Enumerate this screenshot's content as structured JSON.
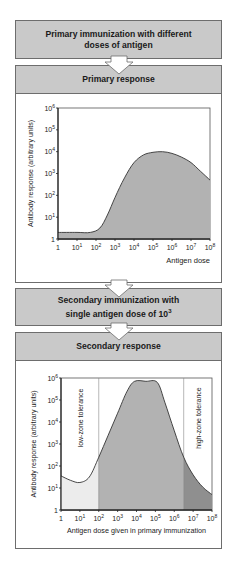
{
  "steps": [
    {
      "title_line1": "Primary immunization with different",
      "title_line2": "doses of antigen"
    },
    {
      "title": "Primary response"
    },
    {
      "title_line1": "Secondary immunization with",
      "title_line2": "single antigen dose of 10",
      "title_sup": "3"
    },
    {
      "title": "Secondary response"
    }
  ],
  "colors": {
    "header_fill": "#c9c9c9",
    "box_border": "#6d6d6d",
    "response_fill": "#b2b2b2",
    "low_zone_fill": "#ececec",
    "high_zone_fill": "#8f8f8f",
    "curve": "#333333"
  },
  "chart_data": [
    {
      "type": "area",
      "title": "Primary response",
      "xlabel": "Antigen dose",
      "ylabel": "Antibody response (arbitrary units)",
      "x_scale": "log",
      "y_scale": "log",
      "xlim": [
        1,
        100000000
      ],
      "ylim": [
        1,
        1000000
      ],
      "x_ticks": [
        "1",
        "10¹",
        "10²",
        "10³",
        "10⁴",
        "10⁵",
        "10⁶",
        "10⁷",
        "10⁸"
      ],
      "y_ticks": [
        "1",
        "10¹",
        "10²",
        "10³",
        "10⁴",
        "10⁵",
        "10⁶"
      ],
      "series": [
        {
          "name": "Antibody response",
          "x_log10": [
            0,
            1,
            1.7,
            2.2,
            2.6,
            3,
            3.5,
            4,
            4.5,
            5,
            5.5,
            6,
            6.5,
            7,
            7.5,
            8
          ],
          "y_log10": [
            0.3,
            0.3,
            0.3,
            0.5,
            1.1,
            1.9,
            2.8,
            3.5,
            3.85,
            3.97,
            4.0,
            3.92,
            3.75,
            3.5,
            3.1,
            2.7
          ]
        }
      ]
    },
    {
      "type": "area",
      "title": "Secondary response",
      "xlabel": "Antigen dose given in primary immunization",
      "ylabel": "Antibody response (arbitrary units)",
      "x_scale": "log",
      "y_scale": "log",
      "xlim": [
        1,
        100000000
      ],
      "ylim": [
        1,
        1000000
      ],
      "x_ticks": [
        "1",
        "10¹",
        "10²",
        "10³",
        "10⁴",
        "10⁵",
        "10⁶",
        "10⁷",
        "10⁸"
      ],
      "y_ticks": [
        "1",
        "10¹",
        "10²",
        "10³",
        "10⁴",
        "10⁵",
        "10⁶"
      ],
      "regions": [
        {
          "label": "low-zone tolerance",
          "x_log10_from": 0,
          "x_log10_to": 2
        },
        {
          "label": "high-zone tolerance",
          "x_log10_from": 6.5,
          "x_log10_to": 8
        }
      ],
      "series": [
        {
          "name": "Antibody response",
          "x_log10": [
            0,
            0.5,
            1,
            1.5,
            2,
            2.5,
            3,
            3.5,
            3.9,
            4.5,
            5.1,
            5.5,
            6,
            6.5,
            7,
            7.5,
            8
          ],
          "y_log10": [
            1.55,
            1.35,
            1.25,
            1.5,
            2.4,
            3.4,
            4.4,
            5.4,
            5.85,
            5.85,
            5.8,
            4.9,
            3.6,
            2.4,
            1.6,
            1.05,
            0.7
          ]
        }
      ]
    }
  ]
}
